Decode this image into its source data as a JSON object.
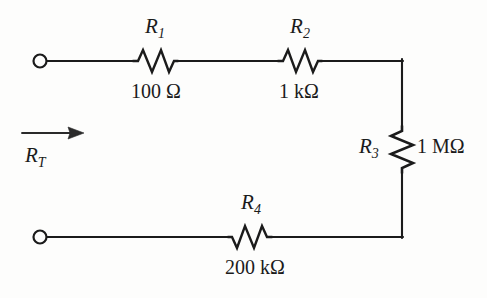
{
  "figure": {
    "name": "series-resistor-network",
    "background_color": "#fdfdfc",
    "line_color": "#1b1b1b",
    "text_color": "#1b1b1b"
  },
  "total_resistance": {
    "symbol": "R",
    "subscript": "T",
    "arrow_direction": "right"
  },
  "terminals": [
    {
      "name": "top-left-terminal",
      "x": 40,
      "y": 61
    },
    {
      "name": "bottom-left-terminal",
      "x": 40,
      "y": 237
    }
  ],
  "components": [
    {
      "id": "R1",
      "symbol": "R",
      "subscript": "1",
      "value": "100 Ω",
      "orientation": "horizontal",
      "label_position": "above",
      "value_position": "below"
    },
    {
      "id": "R2",
      "symbol": "R",
      "subscript": "2",
      "value": "1 kΩ",
      "orientation": "horizontal",
      "label_position": "above",
      "value_position": "below"
    },
    {
      "id": "R3",
      "symbol": "R",
      "subscript": "3",
      "value": "1 MΩ",
      "orientation": "vertical",
      "label_position": "left",
      "value_position": "right"
    },
    {
      "id": "R4",
      "symbol": "R",
      "subscript": "4",
      "value": "200 kΩ",
      "orientation": "horizontal",
      "label_position": "above",
      "value_position": "below"
    }
  ]
}
